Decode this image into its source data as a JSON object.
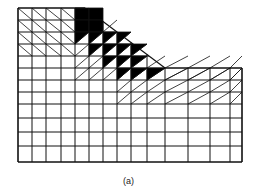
{
  "figure": {
    "caption": "(a)",
    "colors": {
      "line": "#111111",
      "filled": "#000000",
      "background": "#ffffff"
    }
  },
  "mesh": {
    "x_lines": [
      18,
      32,
      46,
      61,
      75,
      89,
      103,
      117,
      131,
      147,
      165,
      188,
      210,
      230,
      242
    ],
    "y_lines": [
      8,
      20,
      32,
      44,
      56,
      68,
      80,
      92,
      104,
      118,
      132,
      146,
      162
    ],
    "crest": {
      "x": 85,
      "y": 8
    },
    "toe": {
      "x": 165,
      "y": 68
    },
    "filled_cells": [
      [
        4,
        0
      ],
      [
        5,
        0
      ],
      [
        4,
        1
      ],
      [
        5,
        1
      ],
      [
        4,
        2
      ],
      [
        5,
        2
      ],
      [
        6,
        2
      ],
      [
        7,
        2
      ],
      [
        5,
        3
      ],
      [
        6,
        3
      ],
      [
        7,
        3
      ],
      [
        8,
        3
      ],
      [
        6,
        4
      ],
      [
        7,
        4
      ],
      [
        8,
        4
      ],
      [
        7,
        5
      ],
      [
        8,
        5
      ],
      [
        9,
        5
      ]
    ]
  }
}
